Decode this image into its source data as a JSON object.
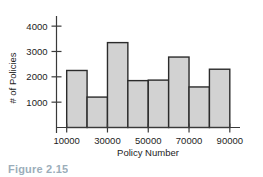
{
  "figure": {
    "caption": "Figure 2.15",
    "caption_color": "#4a6b82",
    "background": "#ffffff"
  },
  "chart_data": {
    "type": "bar",
    "title": "",
    "subtitle": "",
    "xlabel": "Policy Number",
    "ylabel": "# of Policies",
    "categories": [
      "10000-20000",
      "20000-30000",
      "30000-40000",
      "40000-50000",
      "50000-60000",
      "60000-70000",
      "70000-80000",
      "80000-90000"
    ],
    "bin_edges": [
      10000,
      20000,
      30000,
      40000,
      50000,
      60000,
      70000,
      80000,
      90000
    ],
    "values": [
      2250,
      1200,
      3350,
      1850,
      1870,
      2780,
      1600,
      2300
    ],
    "xlim": [
      5000,
      95000
    ],
    "ylim": [
      0,
      4400
    ],
    "xticks": [
      10000,
      30000,
      50000,
      70000,
      90000
    ],
    "xtick_labels": [
      "10000",
      "30000",
      "50000",
      "70000",
      "90000"
    ],
    "yticks": [
      1000,
      2000,
      3000,
      4000
    ],
    "ytick_labels": [
      "1000",
      "2000",
      "3000",
      "4000"
    ],
    "grid": false,
    "legend": false,
    "legend_position": "none",
    "bar_fill_color": "#d2d2d2",
    "bar_edge_color": "#2b2b2b",
    "axis_color": "#3a3a3a",
    "text_color": "#1c1c1c"
  }
}
